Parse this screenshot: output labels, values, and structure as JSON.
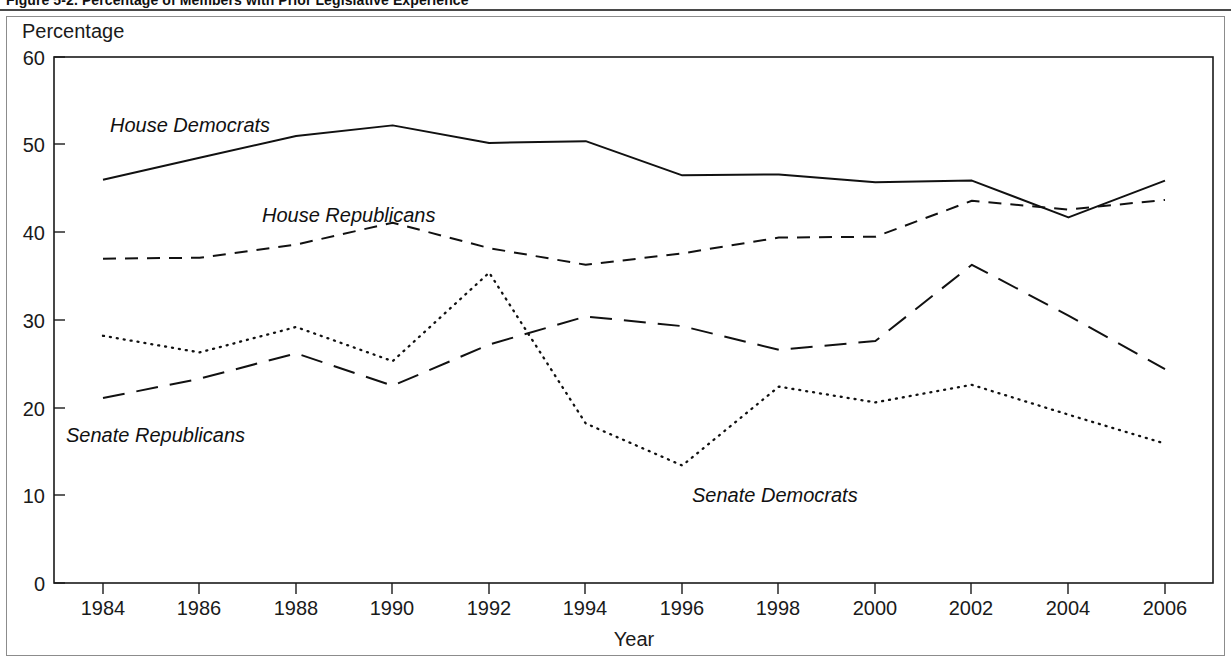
{
  "figure": {
    "caption": "Figure 5-2. Percentage of Members with Prior Legislative Experience",
    "caption_visible_note": "clipped"
  },
  "axes": {
    "y_axis_title": "Percentage",
    "x_axis_title": "Year",
    "y_ticks": [
      "0",
      "10",
      "20",
      "30",
      "40",
      "50",
      "60"
    ],
    "x_ticks": [
      "1984",
      "1986",
      "1988",
      "1990",
      "1992",
      "1994",
      "1996",
      "1998",
      "2000",
      "2002",
      "2004",
      "2006"
    ]
  },
  "series_labels": {
    "house_democrats": "House Democrats",
    "house_republicans": "House Republicans",
    "senate_republicans": "Senate Republicans",
    "senate_democrats": "Senate Democrats"
  },
  "colors": {
    "line": "#111111",
    "axis": "#1a1a1a",
    "frame": "#8c8c8c",
    "background": "#ffffff"
  },
  "chart_data": {
    "type": "line",
    "title": "Figure 5-2. Percentage of Members with Prior Legislative Experience",
    "xlabel": "Year",
    "ylabel": "Percentage",
    "xlim": [
      1983,
      2007
    ],
    "ylim": [
      0,
      60
    ],
    "grid": false,
    "legend": "inline-annotations",
    "x": [
      1984,
      1986,
      1988,
      1990,
      1992,
      1994,
      1996,
      1998,
      2000,
      2002,
      2004,
      2006
    ],
    "categories": [
      "1984",
      "1986",
      "1988",
      "1990",
      "1992",
      "1994",
      "1996",
      "1998",
      "2000",
      "2002",
      "2004",
      "2006"
    ],
    "series": [
      {
        "name": "House Democrats",
        "style": "solid",
        "values": [
          46.0,
          48.5,
          51.0,
          52.2,
          50.2,
          50.4,
          46.5,
          46.6,
          45.7,
          45.9,
          41.7,
          45.9
        ]
      },
      {
        "name": "House Republicans",
        "style": "short-dash",
        "values": [
          37.0,
          37.1,
          38.6,
          41.1,
          38.2,
          36.3,
          37.6,
          39.4,
          39.5,
          43.6,
          42.6,
          43.7
        ]
      },
      {
        "name": "Senate Republicans",
        "style": "long-dash",
        "values": [
          21.1,
          23.3,
          26.2,
          22.5,
          27.2,
          30.4,
          29.3,
          26.6,
          27.6,
          36.3,
          30.5,
          24.4
        ]
      },
      {
        "name": "Senate Democrats",
        "style": "dotted",
        "values": [
          28.2,
          26.3,
          29.2,
          25.3,
          35.4,
          18.2,
          13.4,
          22.4,
          20.6,
          22.6,
          19.2,
          15.9
        ]
      }
    ]
  }
}
